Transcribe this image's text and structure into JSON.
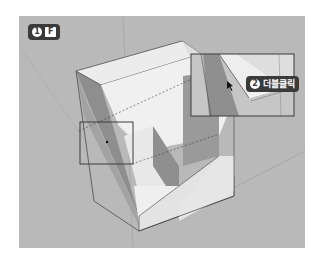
{
  "viewport": {
    "background": "#b9b9b9",
    "object": "l-shaped-block",
    "face_colors": {
      "top": "#ededed",
      "left_shadow": "#8e8e8e",
      "front": "#e2e2e2",
      "inner_wall": "#9a9a9a",
      "edge": "#3c3c3c"
    }
  },
  "steps": [
    {
      "number": "1",
      "key": "F",
      "label": ""
    },
    {
      "number": "2",
      "key": "",
      "label": "더블클릭"
    }
  ],
  "highlight_box": {
    "color": "#3c3c3c"
  },
  "callout_box": {
    "color": "#3c3c3c"
  }
}
